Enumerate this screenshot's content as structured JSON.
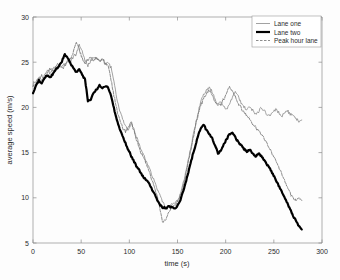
{
  "chart_data": {
    "type": "line",
    "title": "",
    "xlabel": "time (s)",
    "ylabel": "average speed (m/s)",
    "xlim": [
      0,
      300
    ],
    "ylim": [
      5,
      30
    ],
    "xticks": [
      0,
      50,
      100,
      150,
      200,
      250,
      300
    ],
    "yticks": [
      5,
      10,
      15,
      20,
      25,
      30
    ],
    "grid": false,
    "legend_position": "top-right",
    "legend": [
      "Lane one",
      "Lane two",
      "Peak hour lane"
    ],
    "series": [
      {
        "name": "Lane one",
        "color": "#8a8a8a",
        "width": 0.8,
        "style": "thin",
        "x": [
          0,
          3,
          6,
          9,
          12,
          15,
          18,
          21,
          24,
          27,
          30,
          33,
          36,
          39,
          42,
          45,
          48,
          51,
          54,
          57,
          60,
          63,
          66,
          69,
          72,
          75,
          78,
          81,
          84,
          87,
          90,
          93,
          96,
          99,
          102,
          105,
          108,
          111,
          114,
          117,
          120,
          123,
          126,
          129,
          132,
          135,
          138,
          141,
          144,
          147,
          150,
          153,
          156,
          159,
          162,
          165,
          168,
          171,
          174,
          177,
          180,
          183,
          186,
          189,
          192,
          195,
          198,
          201,
          204,
          207,
          210,
          213,
          216,
          219,
          222,
          225,
          228,
          231,
          234,
          237,
          240,
          243,
          246,
          249,
          252,
          255,
          258,
          261,
          264,
          267,
          270,
          273,
          276,
          279
        ],
        "y": [
          22.6,
          22.9,
          23.3,
          23.0,
          23.6,
          24.1,
          23.8,
          24.3,
          24.6,
          24.9,
          24.5,
          24.8,
          25.2,
          25.0,
          25.6,
          26.0,
          26.9,
          26.2,
          25.3,
          24.6,
          25.2,
          25.6,
          25.4,
          25.1,
          25.4,
          24.8,
          25.0,
          24.4,
          22.8,
          21.0,
          19.6,
          18.7,
          18.0,
          17.5,
          18.3,
          17.6,
          16.5,
          15.6,
          14.9,
          14.2,
          13.5,
          12.6,
          11.8,
          11.0,
          10.1,
          9.4,
          8.9,
          9.0,
          9.3,
          9.4,
          9.6,
          10.4,
          11.6,
          13.0,
          14.6,
          16.2,
          17.8,
          19.3,
          20.6,
          21.4,
          21.9,
          22.2,
          21.7,
          20.9,
          20.4,
          20.6,
          20.1,
          19.7,
          20.3,
          21.2,
          21.8,
          21.3,
          20.5,
          20.0,
          19.7,
          20.1,
          19.6,
          19.2,
          19.5,
          20.0,
          19.6,
          19.2,
          19.0,
          19.4,
          19.8,
          19.4,
          19.0,
          19.3,
          19.6,
          19.3,
          19.0,
          18.8,
          18.4,
          18.6
        ]
      },
      {
        "name": "Peak hour lane",
        "color": "#707070",
        "width": 0.8,
        "style": "thin-dashed",
        "x": [
          0,
          3,
          6,
          9,
          12,
          15,
          18,
          21,
          24,
          27,
          30,
          33,
          36,
          39,
          42,
          45,
          48,
          51,
          54,
          57,
          60,
          63,
          66,
          69,
          72,
          75,
          78,
          81,
          84,
          87,
          90,
          93,
          96,
          99,
          102,
          105,
          108,
          111,
          114,
          117,
          120,
          123,
          126,
          129,
          132,
          135,
          138,
          141,
          144,
          147,
          150,
          153,
          156,
          159,
          162,
          165,
          168,
          171,
          174,
          177,
          180,
          183,
          186,
          189,
          192,
          195,
          198,
          201,
          204,
          207,
          210,
          213,
          216,
          219,
          222,
          225,
          228,
          231,
          234,
          237,
          240,
          243,
          246,
          249,
          252,
          255,
          258,
          261,
          264,
          267,
          270,
          273,
          276,
          279
        ],
        "y": [
          22.4,
          22.7,
          23.1,
          23.5,
          23.2,
          23.9,
          24.2,
          24.0,
          24.4,
          24.7,
          24.3,
          24.6,
          25.0,
          25.4,
          26.1,
          27.3,
          26.4,
          25.5,
          24.9,
          25.3,
          25.6,
          25.2,
          25.5,
          25.1,
          25.3,
          24.9,
          24.6,
          23.0,
          21.3,
          19.8,
          18.6,
          17.8,
          17.2,
          17.9,
          18.4,
          17.3,
          16.2,
          15.3,
          14.6,
          13.9,
          13.1,
          12.2,
          11.3,
          10.2,
          8.6,
          7.2,
          7.6,
          8.4,
          9.0,
          9.2,
          9.5,
          10.2,
          11.3,
          12.7,
          14.3,
          15.9,
          17.6,
          19.0,
          20.2,
          21.0,
          21.6,
          21.9,
          21.4,
          20.7,
          20.2,
          20.4,
          20.9,
          21.6,
          22.2,
          21.8,
          21.1,
          20.4,
          19.9,
          19.5,
          19.1,
          18.6,
          18.2,
          17.8,
          17.4,
          17.0,
          16.5,
          16.0,
          15.4,
          14.8,
          14.1,
          13.4,
          12.6,
          11.9,
          11.2,
          10.5,
          9.9,
          9.6,
          10.0,
          9.7
        ]
      },
      {
        "name": "Lane two",
        "color": "#000000",
        "width": 2.2,
        "style": "bold",
        "x": [
          0,
          3,
          6,
          9,
          12,
          15,
          18,
          21,
          24,
          27,
          30,
          33,
          36,
          39,
          42,
          45,
          48,
          51,
          54,
          57,
          60,
          63,
          66,
          69,
          72,
          75,
          78,
          81,
          84,
          87,
          90,
          93,
          96,
          99,
          102,
          105,
          108,
          111,
          114,
          117,
          120,
          123,
          126,
          129,
          132,
          135,
          138,
          141,
          144,
          147,
          150,
          153,
          156,
          159,
          162,
          165,
          168,
          171,
          174,
          177,
          180,
          183,
          186,
          189,
          192,
          195,
          198,
          201,
          204,
          207,
          210,
          213,
          216,
          219,
          222,
          225,
          228,
          231,
          234,
          237,
          240,
          243,
          246,
          249,
          252,
          255,
          258,
          261,
          264,
          267,
          270,
          273,
          276,
          279
        ],
        "y": [
          21.6,
          22.4,
          23.0,
          22.7,
          23.2,
          23.6,
          23.3,
          23.8,
          24.2,
          24.6,
          25.1,
          25.8,
          25.4,
          24.9,
          24.3,
          23.9,
          24.2,
          23.6,
          23.1,
          20.7,
          20.9,
          21.6,
          22.0,
          22.4,
          22.1,
          22.4,
          22.2,
          21.3,
          19.9,
          18.6,
          17.6,
          16.8,
          16.0,
          15.3,
          14.6,
          14.0,
          13.4,
          12.9,
          12.4,
          12.0,
          11.7,
          11.0,
          10.4,
          9.8,
          9.2,
          8.9,
          8.9,
          9.0,
          9.0,
          8.8,
          9.1,
          9.8,
          10.8,
          11.9,
          13.2,
          14.4,
          15.6,
          16.8,
          17.6,
          18.1,
          17.5,
          17.0,
          16.6,
          15.8,
          14.9,
          15.2,
          15.9,
          16.5,
          17.0,
          17.2,
          16.7,
          16.2,
          15.8,
          15.4,
          15.1,
          15.3,
          14.9,
          14.6,
          14.9,
          14.6,
          14.2,
          13.7,
          13.2,
          12.6,
          12.0,
          11.4,
          10.7,
          10.0,
          9.4,
          8.7,
          8.0,
          7.4,
          6.9,
          6.5
        ]
      }
    ]
  },
  "axis": {
    "x_tick_labels": [
      "0",
      "50",
      "100",
      "150",
      "200",
      "250",
      "300"
    ],
    "y_tick_labels": [
      "5",
      "10",
      "15",
      "20",
      "25",
      "30"
    ]
  },
  "colors": {
    "background": "#fdfdfd",
    "axis": "#8d8d8d",
    "text": "#2b2b2b",
    "lane_one": "#8a8a8a",
    "lane_two": "#000000",
    "peak_hour_lane": "#707070"
  }
}
